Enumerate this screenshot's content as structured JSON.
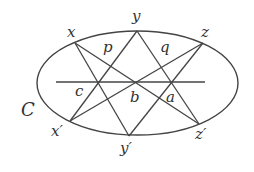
{
  "diagram": {
    "title": "",
    "curve": {
      "label": "C",
      "cx": 137.5,
      "cy": 83,
      "rx": 100.5,
      "ry": 52
    },
    "stroke_color": "#444444",
    "points_on_curve": [
      {
        "name": "x",
        "label": "x",
        "px": 75,
        "py": 43
      },
      {
        "name": "y",
        "label": "y",
        "px": 137,
        "py": 31
      },
      {
        "name": "z",
        "label": "z",
        "px": 203,
        "py": 43
      },
      {
        "name": "x-prime",
        "label": "x′",
        "px": 70,
        "py": 121
      },
      {
        "name": "y-prime",
        "label": "y′",
        "px": 129,
        "py": 136
      },
      {
        "name": "z-prime",
        "label": "z′",
        "px": 199,
        "py": 124
      }
    ],
    "lines": [
      {
        "name": "line-x-yprime",
        "from": "x",
        "to": "y′"
      },
      {
        "name": "line-xprime-y",
        "from": "x′",
        "to": "y"
      },
      {
        "name": "line-x-zprime",
        "from": "x",
        "to": "z′"
      },
      {
        "name": "line-xprime-z",
        "from": "x′",
        "to": "z"
      },
      {
        "name": "line-y-zprime",
        "from": "y",
        "to": "z′"
      },
      {
        "name": "line-yprime-z",
        "from": "y′",
        "to": "z"
      },
      {
        "name": "pascal-line",
        "from": "left",
        "to": "right",
        "x1": 56,
        "y1": 82,
        "x2": 205,
        "y2": 82
      }
    ],
    "intersection_labels": [
      {
        "name": "p",
        "label": "p"
      },
      {
        "name": "q",
        "label": "q"
      },
      {
        "name": "c",
        "label": "c"
      },
      {
        "name": "b",
        "label": "b"
      },
      {
        "name": "a",
        "label": "a"
      }
    ]
  }
}
